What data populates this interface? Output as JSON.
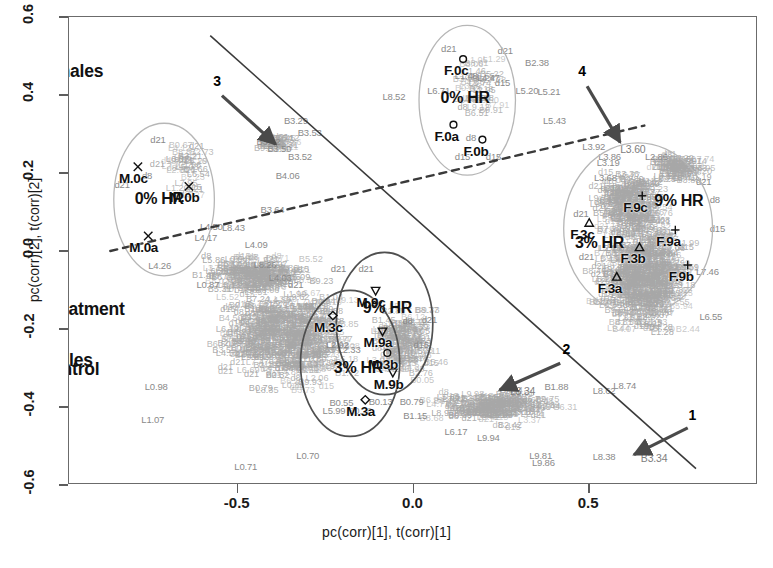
{
  "figure": {
    "type": "scatter"
  },
  "axes": {
    "x_title": "pc(corr)[1], t(corr)[1]",
    "y_title": "pc(corr)[2], t(corr)[2]",
    "x_ticks": [
      "-0.5",
      "0.0",
      "0.5"
    ],
    "y_ticks": [
      "0.6",
      "0.4",
      "0.2",
      "0.0",
      "-0.2",
      "-0.4",
      "-0.6"
    ],
    "x_range": [
      -0.82,
      0.78
    ],
    "y_range": [
      -0.66,
      0.72
    ]
  },
  "group_titles": [
    {
      "label": "Control",
      "x": 0.345,
      "y": 0.755
    },
    {
      "label": "Females",
      "x": 0.862,
      "y": 0.118
    },
    {
      "label": "Males",
      "x": 0.165,
      "y": 0.735
    },
    {
      "label": "HR Treatment",
      "x": 0.64,
      "y": 0.625
    }
  ],
  "cluster_labels": [
    {
      "label": "0% HR",
      "group": "male-control",
      "x": 0.131,
      "y": 0.392
    },
    {
      "label": "0% HR",
      "group": "female-control",
      "x": 0.575,
      "y": 0.175
    },
    {
      "label": "9% HR",
      "group": "male-treatment",
      "x": 0.462,
      "y": 0.623
    },
    {
      "label": "3% HR",
      "group": "male-treatment",
      "x": 0.42,
      "y": 0.753
    },
    {
      "label": "9% HR",
      "group": "female-treatment",
      "x": 0.885,
      "y": 0.395
    },
    {
      "label": "3% HR",
      "group": "female-treatment",
      "x": 0.77,
      "y": 0.485
    }
  ],
  "sample_points": [
    {
      "id": "M.0c",
      "marker": "x",
      "x": 0.1,
      "y": 0.32
    },
    {
      "id": "M.0b",
      "marker": "x",
      "x": 0.174,
      "y": 0.362
    },
    {
      "id": "M.0a",
      "marker": "x",
      "x": 0.115,
      "y": 0.468
    },
    {
      "id": "F.0c",
      "marker": "circle",
      "x": 0.572,
      "y": 0.09
    },
    {
      "id": "F.0a",
      "marker": "circle",
      "x": 0.558,
      "y": 0.23
    },
    {
      "id": "F.0b",
      "marker": "circle",
      "x": 0.6,
      "y": 0.262
    },
    {
      "id": "M.9c",
      "marker": "nabla",
      "x": 0.445,
      "y": 0.585
    },
    {
      "id": "M.9a",
      "marker": "nabla",
      "x": 0.455,
      "y": 0.672
    },
    {
      "id": "M.3c",
      "marker": "diamond",
      "x": 0.383,
      "y": 0.638
    },
    {
      "id": "M.3b",
      "marker": "circle",
      "x": 0.462,
      "y": 0.718
    },
    {
      "id": "M.9b",
      "marker": "nabla",
      "x": 0.47,
      "y": 0.76
    },
    {
      "id": "M.3a",
      "marker": "diamond",
      "x": 0.43,
      "y": 0.818
    },
    {
      "id": "F.9c",
      "marker": "plus",
      "x": 0.832,
      "y": 0.382
    },
    {
      "id": "F.9a",
      "marker": "plus",
      "x": 0.88,
      "y": 0.455
    },
    {
      "id": "F.9b",
      "marker": "plus",
      "x": 0.898,
      "y": 0.53
    },
    {
      "id": "F.3c",
      "marker": "triangle",
      "x": 0.755,
      "y": 0.44
    },
    {
      "id": "F.3b",
      "marker": "triangle",
      "x": 0.828,
      "y": 0.492
    },
    {
      "id": "F.3a",
      "marker": "triangle",
      "x": 0.795,
      "y": 0.555
    }
  ],
  "arrows": [
    {
      "number": "1",
      "label_x": 0.905,
      "label_y": 0.852,
      "tail_x": 0.898,
      "tail_y": 0.878,
      "head_x": 0.82,
      "head_y": 0.935
    },
    {
      "number": "2",
      "label_x": 0.722,
      "label_y": 0.712,
      "tail_x": 0.713,
      "tail_y": 0.74,
      "head_x": 0.625,
      "head_y": 0.797
    },
    {
      "number": "3",
      "label_x": 0.215,
      "label_y": 0.138,
      "tail_x": 0.222,
      "tail_y": 0.168,
      "head_x": 0.3,
      "head_y": 0.272
    },
    {
      "number": "4",
      "label_x": 0.745,
      "label_y": 0.118,
      "tail_x": 0.752,
      "tail_y": 0.148,
      "head_x": 0.8,
      "head_y": 0.268
    }
  ],
  "divider_lines": [
    {
      "name": "control-treatment-solid",
      "style": "solid",
      "x1": 0.205,
      "y1": 0.04,
      "x2": 0.91,
      "y2": 0.965
    },
    {
      "name": "males-females-dashed",
      "style": "dashed",
      "x1": 0.06,
      "y1": 0.5,
      "x2": 0.835,
      "y2": 0.232
    }
  ],
  "ellipses": [
    {
      "name": "male-0hr",
      "cx": 0.138,
      "cy": 0.39,
      "rx": 0.073,
      "ry": 0.163,
      "tone": "light"
    },
    {
      "name": "female-0hr",
      "cx": 0.578,
      "cy": 0.178,
      "rx": 0.07,
      "ry": 0.16,
      "tone": "light"
    },
    {
      "name": "female-hr",
      "cx": 0.826,
      "cy": 0.452,
      "rx": 0.108,
      "ry": 0.183,
      "tone": "light"
    },
    {
      "name": "male-9hr",
      "cx": 0.458,
      "cy": 0.655,
      "rx": 0.07,
      "ry": 0.152,
      "tone": "dark"
    },
    {
      "name": "male-3hr",
      "cx": 0.408,
      "cy": 0.74,
      "rx": 0.072,
      "ry": 0.156,
      "tone": "dark"
    }
  ],
  "variable_labels": [
    {
      "t": "L8.52",
      "x": 0.455,
      "y": 0.17,
      "c": "dk"
    },
    {
      "t": "B2.38",
      "x": 0.662,
      "y": 0.098,
      "c": "dk"
    },
    {
      "t": "L5.20",
      "x": 0.648,
      "y": 0.158,
      "c": "dk"
    },
    {
      "t": "L5.21",
      "x": 0.68,
      "y": 0.16,
      "c": "dk"
    },
    {
      "t": "L5.43",
      "x": 0.688,
      "y": 0.222,
      "c": "dk"
    },
    {
      "t": "L1.48",
      "x": 0.56,
      "y": 0.126,
      "c": "dk"
    },
    {
      "t": "L4.47",
      "x": 0.592,
      "y": 0.13,
      "c": "dk"
    },
    {
      "t": "L6.71",
      "x": 0.52,
      "y": 0.158,
      "c": "dk"
    },
    {
      "t": "B3.29",
      "x": 0.312,
      "y": 0.222,
      "c": "dk"
    },
    {
      "t": "B3.53",
      "x": 0.332,
      "y": 0.248,
      "c": "dk"
    },
    {
      "t": "B3.52",
      "x": 0.318,
      "y": 0.3,
      "c": "dk"
    },
    {
      "t": "B3.50",
      "x": 0.288,
      "y": 0.282,
      "c": "dk"
    },
    {
      "t": "B3.62",
      "x": 0.272,
      "y": 0.268,
      "c": "dk"
    },
    {
      "t": "B4.06",
      "x": 0.3,
      "y": 0.34,
      "c": "dk"
    },
    {
      "t": "B3.64",
      "x": 0.278,
      "y": 0.412,
      "c": "dk"
    },
    {
      "t": "L3.92",
      "x": 0.745,
      "y": 0.278,
      "c": "dk"
    },
    {
      "t": "L3.60",
      "x": 0.8,
      "y": 0.282,
      "c": "near"
    },
    {
      "t": "L3.86",
      "x": 0.768,
      "y": 0.3,
      "c": "dk"
    },
    {
      "t": "L3.19",
      "x": 0.766,
      "y": 0.312,
      "c": "dk"
    },
    {
      "t": "L3.68",
      "x": 0.762,
      "y": 0.345,
      "c": "dk"
    },
    {
      "t": "L3.34",
      "x": 0.64,
      "y": 0.8,
      "c": "near"
    },
    {
      "t": "B1.88",
      "x": 0.69,
      "y": 0.79,
      "c": "dk"
    },
    {
      "t": "B3.34",
      "x": 0.83,
      "y": 0.942,
      "c": "near"
    },
    {
      "t": "L8.38",
      "x": 0.76,
      "y": 0.94,
      "c": "dk"
    },
    {
      "t": "L9.81",
      "x": 0.668,
      "y": 0.938,
      "c": "dk"
    },
    {
      "t": "L9.86",
      "x": 0.672,
      "y": 0.952,
      "c": "dk"
    },
    {
      "t": "L6.17",
      "x": 0.545,
      "y": 0.886,
      "c": "dk"
    },
    {
      "t": "L9.94",
      "x": 0.592,
      "y": 0.9,
      "c": "dk"
    },
    {
      "t": "B0.79",
      "x": 0.48,
      "y": 0.822,
      "c": "dk"
    },
    {
      "t": "B1.15",
      "x": 0.485,
      "y": 0.852,
      "c": "dk"
    },
    {
      "t": "B0.13",
      "x": 0.435,
      "y": 0.822,
      "c": "dk"
    },
    {
      "t": "B0.76",
      "x": 0.405,
      "y": 0.842,
      "c": "dk"
    },
    {
      "t": "B0.55",
      "x": 0.378,
      "y": 0.824,
      "c": "dk"
    },
    {
      "t": "L5.99",
      "x": 0.368,
      "y": 0.842,
      "c": "dk"
    },
    {
      "t": "L8.62",
      "x": 0.76,
      "y": 0.8,
      "c": "dk"
    },
    {
      "t": "L8.74",
      "x": 0.79,
      "y": 0.788,
      "c": "dk"
    },
    {
      "t": "L7.46",
      "x": 0.91,
      "y": 0.545,
      "c": "dk"
    },
    {
      "t": "L6.55",
      "x": 0.915,
      "y": 0.64,
      "c": "dk"
    },
    {
      "t": "L2.86",
      "x": 0.836,
      "y": 0.3,
      "c": "dk"
    },
    {
      "t": "L4.26",
      "x": 0.115,
      "y": 0.533,
      "c": "dk"
    },
    {
      "t": "L4.09",
      "x": 0.255,
      "y": 0.488,
      "c": "dk"
    },
    {
      "t": "L8.43",
      "x": 0.222,
      "y": 0.45,
      "c": "dk"
    },
    {
      "t": "L4.50",
      "x": 0.19,
      "y": 0.448,
      "c": "dk"
    },
    {
      "t": "L4.17",
      "x": 0.182,
      "y": 0.472,
      "c": "dk"
    },
    {
      "t": "L8.26",
      "x": 0.268,
      "y": 0.53,
      "c": "dk"
    },
    {
      "t": "L4.03",
      "x": 0.29,
      "y": 0.558,
      "c": "dk"
    },
    {
      "t": "L0.87",
      "x": 0.185,
      "y": 0.572,
      "c": "dk"
    },
    {
      "t": "L2.92",
      "x": 0.373,
      "y": 0.7,
      "c": "dk"
    },
    {
      "t": "L0.98",
      "x": 0.11,
      "y": 0.79,
      "c": "dk"
    },
    {
      "t": "L1.07",
      "x": 0.105,
      "y": 0.862,
      "c": "dk"
    },
    {
      "t": "L0.70",
      "x": 0.33,
      "y": 0.938,
      "c": "dk"
    },
    {
      "t": "L0.71",
      "x": 0.24,
      "y": 0.962,
      "c": "dk"
    },
    {
      "t": "L2.33",
      "x": 0.39,
      "y": 0.712,
      "c": "dk"
    },
    {
      "t": "d21",
      "x": 0.38,
      "y": 0.538,
      "c": "dk"
    },
    {
      "t": "d21",
      "x": 0.42,
      "y": 0.538,
      "c": "dk"
    },
    {
      "t": "d21",
      "x": 0.318,
      "y": 0.572,
      "c": "dk"
    },
    {
      "t": "d21",
      "x": 0.512,
      "y": 0.648,
      "c": "dk"
    },
    {
      "t": "d15",
      "x": 0.5,
      "y": 0.7,
      "c": "dk"
    },
    {
      "t": "d8",
      "x": 0.484,
      "y": 0.65,
      "c": "dk"
    },
    {
      "t": "d21",
      "x": 0.066,
      "y": 0.36,
      "c": "dk"
    },
    {
      "t": "d21",
      "x": 0.118,
      "y": 0.262,
      "c": "dk"
    },
    {
      "t": "d8",
      "x": 0.106,
      "y": 0.34,
      "c": "dk"
    },
    {
      "t": "d21",
      "x": 0.54,
      "y": 0.068,
      "c": "dk"
    },
    {
      "t": "d21",
      "x": 0.622,
      "y": 0.072,
      "c": "dk"
    },
    {
      "t": "d15",
      "x": 0.618,
      "y": 0.14,
      "c": "dk"
    },
    {
      "t": "d15",
      "x": 0.56,
      "y": 0.3,
      "c": "dk"
    },
    {
      "t": "d15",
      "x": 0.605,
      "y": 0.3,
      "c": "dk"
    },
    {
      "t": "d8",
      "x": 0.576,
      "y": 0.258,
      "c": "dk"
    },
    {
      "t": "d21",
      "x": 0.732,
      "y": 0.422,
      "c": "dk"
    },
    {
      "t": "d21",
      "x": 0.74,
      "y": 0.512,
      "c": "dk"
    },
    {
      "t": "d8",
      "x": 0.93,
      "y": 0.392,
      "c": "dk"
    },
    {
      "t": "d15",
      "x": 0.93,
      "y": 0.452,
      "c": "dk"
    },
    {
      "t": "d21",
      "x": 0.91,
      "y": 0.352,
      "c": "dk"
    }
  ]
}
